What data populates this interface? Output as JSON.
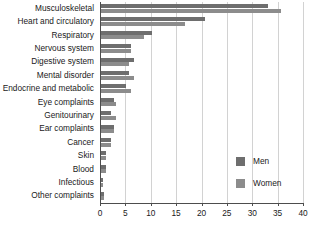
{
  "chart_data": {
    "type": "bar",
    "orientation": "horizontal",
    "title": "",
    "xlabel": "",
    "ylabel": "",
    "xlim": [
      0,
      40
    ],
    "xticks": [
      0,
      5,
      10,
      15,
      20,
      25,
      30,
      35,
      40
    ],
    "grid": true,
    "legend_position": "right",
    "categories": [
      "Musculoskeletal",
      "Heart and circulatory",
      "Respiratory",
      "Nervous system",
      "Digestive system",
      "Mental disorder",
      "Endocrine and metabolic",
      "Eye complaints",
      "Genitourinary",
      "Ear complaints",
      "Cancer",
      "Skin",
      "Blood",
      "Infectious",
      "Other complaints"
    ],
    "series": [
      {
        "name": "Men",
        "color": "#6e6e6e",
        "values": [
          33.0,
          20.5,
          10.0,
          6.0,
          6.5,
          5.5,
          5.0,
          2.5,
          2.0,
          2.5,
          2.0,
          1.0,
          1.0,
          0.4,
          0.5
        ]
      },
      {
        "name": "Women",
        "color": "#8c8c8c",
        "values": [
          35.5,
          16.5,
          8.5,
          6.0,
          5.5,
          6.5,
          6.0,
          3.0,
          3.0,
          2.5,
          2.0,
          1.0,
          1.0,
          0.3,
          0.6
        ]
      }
    ]
  },
  "legend": {
    "items": [
      {
        "label": "Men",
        "color": "#6e6e6e"
      },
      {
        "label": "Women",
        "color": "#8c8c8c"
      }
    ]
  }
}
